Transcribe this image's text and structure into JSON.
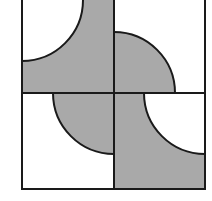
{
  "diagram": {
    "title": "",
    "colors": {
      "background": "#ffffff",
      "shade": "#a9a9a9",
      "stroke": "#1a1a1a"
    },
    "frame": {
      "x": 22,
      "y": 0,
      "x2": 205,
      "y2": 189,
      "midX": 114,
      "midY": 93
    },
    "radius": 61,
    "cells": [
      {
        "id": "top-left",
        "shape": "white quarter circle at top-left corner, remainder shaded"
      },
      {
        "id": "top-right",
        "shape": "shaded quarter circle at bottom-left corner, remainder white"
      },
      {
        "id": "bottom-left",
        "shape": "shaded quarter circle at top-right corner, remainder white"
      },
      {
        "id": "bottom-right",
        "shape": "white quarter circle at top-right corner, remainder shaded"
      }
    ]
  }
}
